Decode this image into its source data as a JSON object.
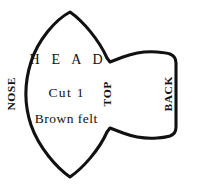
{
  "document": {
    "kind": "sewing-pattern-piece",
    "title": "HEAD"
  },
  "pattern": {
    "name": "HEAD",
    "outline_color": "#111111",
    "fill_color": "#ffffff",
    "outline_width_px": 3
  },
  "labels": {
    "piece_name": "H E A D",
    "cut_count": "Cut 1",
    "material": "Brown felt",
    "edge_left": "NOSE",
    "edge_middle": "TOP",
    "edge_right": "BACK"
  }
}
